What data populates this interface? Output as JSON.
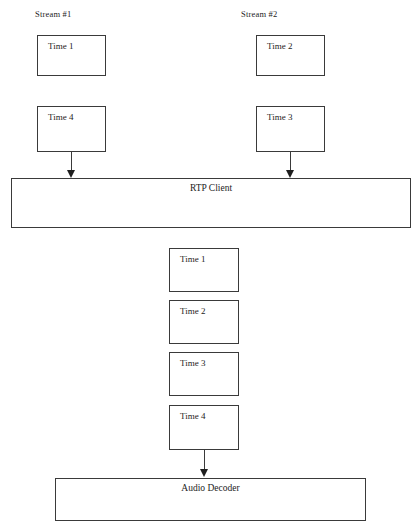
{
  "diagram": {
    "background_color": "#ffffff",
    "stroke_color": "#3a3a3a",
    "text_color": "#1c1c1c",
    "streams": [
      {
        "label": "Stream #1"
      },
      {
        "label": "Stream #2"
      }
    ],
    "incoming_packets": [
      {
        "label": "Time 1",
        "stream": "Stream #1",
        "row": "top"
      },
      {
        "label": "Time 2",
        "stream": "Stream #2",
        "row": "top"
      },
      {
        "label": "Time 4",
        "stream": "Stream #1",
        "row": "bottom"
      },
      {
        "label": "Time 3",
        "stream": "Stream #2",
        "row": "bottom"
      }
    ],
    "rtp_client": {
      "label": "RTP Client"
    },
    "ordered_packets": [
      {
        "label": "Time 1"
      },
      {
        "label": "Time 2"
      },
      {
        "label": "Time 3"
      },
      {
        "label": "Time 4"
      }
    ],
    "audio_decoder": {
      "label": "Audio Decoder"
    },
    "connectors": [
      {
        "name": "stream1-to-rtp-client",
        "from": "Time 4",
        "to": "RTP Client"
      },
      {
        "name": "stream2-to-rtp-client",
        "from": "Time 3",
        "to": "RTP Client"
      },
      {
        "name": "queue-to-audio-decoder",
        "from": "Time 4",
        "to": "Audio Decoder"
      }
    ]
  }
}
